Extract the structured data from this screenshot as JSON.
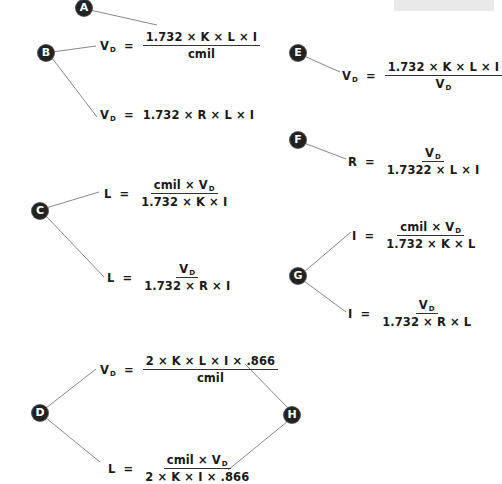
{
  "diagram": {
    "colors": {
      "badge": "#222222",
      "line": "#888888",
      "text": "#1a1a1a",
      "corner_box": "#e9e9e9"
    },
    "labels": {
      "A": "A",
      "B": "B",
      "C": "C",
      "D": "D",
      "E": "E",
      "F": "F",
      "G": "G",
      "H": "H"
    },
    "formulas": {
      "b1": {
        "lhs": "V",
        "lhs_sub": "D",
        "eq": "=",
        "num": "1.732 × K × L × I",
        "den": "cmil"
      },
      "b2": {
        "lhs": "V",
        "lhs_sub": "D",
        "eq": "=",
        "rhs": "1.732 × R × L × I"
      },
      "c1": {
        "lhs": "L",
        "eq": "=",
        "num": "cmil × V",
        "num_sub": "D",
        "den": "1.732 × K × I"
      },
      "c2": {
        "lhs": "L",
        "eq": "=",
        "num": "V",
        "num_sub": "D",
        "den": "1.732 × R × I"
      },
      "d1": {
        "lhs": "V",
        "lhs_sub": "D",
        "eq": "=",
        "num": "2 × K × L × I × .866",
        "den": "cmil"
      },
      "d2": {
        "lhs": "L",
        "eq": "=",
        "num": "cmil × V",
        "num_sub": "D",
        "den": "2 × K × I × .866"
      },
      "e1": {
        "lhs": "V",
        "lhs_sub": "D",
        "eq": "=",
        "num": "1.732 × K × L × I",
        "den": "V",
        "den_sub": "D"
      },
      "f1": {
        "lhs": "R",
        "eq": "=",
        "num": "V",
        "num_sub": "D",
        "den": "1.7322 × L × I"
      },
      "g1": {
        "lhs": "I",
        "eq": "=",
        "num": "cmil × V",
        "num_sub": "D",
        "den": "1.732 × K × L"
      },
      "g2": {
        "lhs": "I",
        "eq": "=",
        "num": "V",
        "num_sub": "D",
        "den": "1.732 × R × L"
      }
    }
  }
}
